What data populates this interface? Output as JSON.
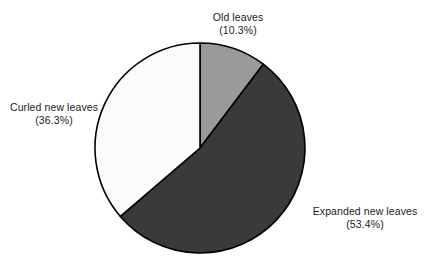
{
  "chart_data": {
    "type": "pie",
    "title": "",
    "subtitle": "",
    "xlabel": "",
    "ylabel": "",
    "legend_position": "none",
    "grid": false,
    "labels_outside": true,
    "start_angle_deg": 0,
    "direction": "clockwise",
    "categories": [
      "Old leaves",
      "Expanded new leaves",
      "Curled new leaves"
    ],
    "values": [
      10.3,
      53.4,
      36.3
    ],
    "units": "percent",
    "slices": [
      {
        "label": "Old leaves",
        "percent": 10.3,
        "percent_text": "(10.3%)",
        "color": "#9a9a9a",
        "start_deg": 0,
        "end_deg": 37.08
      },
      {
        "label": "Expanded new leaves",
        "percent": 53.4,
        "percent_text": "(53.4%)",
        "color": "#3a3a3a",
        "start_deg": 37.08,
        "end_deg": 229.32
      },
      {
        "label": "Curled new leaves",
        "percent": 36.3,
        "percent_text": "(36.3%)",
        "color": "#fbfbfb",
        "start_deg": 229.32,
        "end_deg": 360
      }
    ]
  },
  "geometry": {
    "center_x": 200,
    "center_y": 148,
    "radius": 105,
    "stroke_color": "#000000",
    "stroke_width": 1.6,
    "background": "#ffffff"
  },
  "labels": {
    "old": {
      "name": "Old leaves",
      "pct": "(10.3%)"
    },
    "expanded": {
      "name": "Expanded new leaves",
      "pct": "(53.4%)"
    },
    "curled": {
      "name": "Curled new leaves",
      "pct": "(36.3%)"
    }
  }
}
